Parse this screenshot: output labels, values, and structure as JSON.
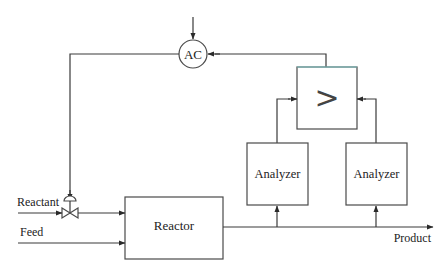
{
  "diagram": {
    "title": "",
    "type": "process control block diagram",
    "nodes": {
      "controller": {
        "label": "AC",
        "shape": "circle"
      },
      "selector": {
        "label": ">",
        "shape": "box"
      },
      "analyzer_1": {
        "label": "Analyzer",
        "shape": "box"
      },
      "analyzer_2": {
        "label": "Analyzer",
        "shape": "box"
      },
      "reactor": {
        "label": "Reactor",
        "shape": "box"
      },
      "valve": {
        "label": "",
        "shape": "control-valve"
      }
    },
    "streams": {
      "reactant": "Reactant",
      "feed": "Feed",
      "product": "Product"
    },
    "edges": [
      {
        "from": "setpoint",
        "to": "controller"
      },
      {
        "from": "selector",
        "to": "controller"
      },
      {
        "from": "controller",
        "to": "valve"
      },
      {
        "from": "reactant",
        "to": "valve"
      },
      {
        "from": "valve",
        "to": "reactor"
      },
      {
        "from": "feed",
        "to": "reactor"
      },
      {
        "from": "reactor",
        "to": "product"
      },
      {
        "from": "product",
        "to": "analyzer_1"
      },
      {
        "from": "product",
        "to": "analyzer_2"
      },
      {
        "from": "analyzer_1",
        "to": "selector"
      },
      {
        "from": "analyzer_2",
        "to": "selector"
      }
    ],
    "colors": {
      "line": "#3a3a3a",
      "text": "#222222",
      "selector_top_edge": "#7fc8c8"
    }
  }
}
